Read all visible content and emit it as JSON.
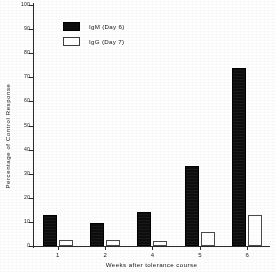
{
  "chart_data": {
    "type": "bar",
    "title": "",
    "subtitle": "",
    "xlabel": "Weeks after  tolerance course",
    "ylabel": "Percentage  of  Control   Response",
    "categories": [
      "1",
      "2",
      "4",
      "5",
      "6"
    ],
    "ylim": [
      0,
      100
    ],
    "ytick_values": [
      0,
      10,
      20,
      30,
      40,
      50,
      60,
      70,
      80,
      90,
      100
    ],
    "ytick_labels": [
      "0",
      "10",
      "20",
      "30",
      "40",
      "50",
      "60",
      "70",
      "80",
      "90",
      "100"
    ],
    "grid": false,
    "legend_position": "upper-left-inside",
    "series": [
      {
        "name": "IgM (Day 6)",
        "color": "#0d0d0d",
        "style": "filled",
        "values": [
          13,
          9.5,
          14,
          33,
          74
        ]
      },
      {
        "name": "IgG (Day 7)",
        "color": "#ffffff",
        "style": "open",
        "values": [
          2.5,
          2.5,
          2,
          6,
          13
        ]
      }
    ]
  },
  "legend": {
    "items": [
      {
        "label": "IgM (Day 6)",
        "swatch": "filled-black-square"
      },
      {
        "label": "IgG (Day 7)",
        "swatch": "open-white-square"
      }
    ]
  },
  "axes": {
    "y_title": "Percentage  of  Control   Response",
    "x_title": "Weeks after  tolerance course"
  },
  "colors": {
    "ink": "#141414",
    "axis": "#2b2b2b",
    "bar_filled": "#0d0d0d",
    "bar_open_fill": "#ffffff",
    "bar_open_stroke": "#4a4a4a",
    "paper": "#fefefe"
  }
}
